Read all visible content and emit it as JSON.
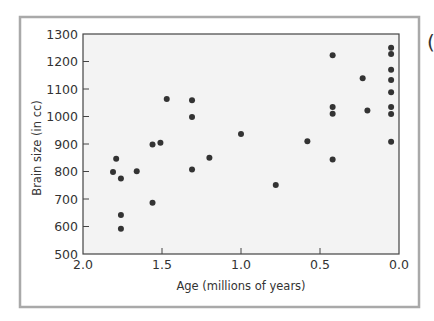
{
  "chart_data": {
    "type": "scatter",
    "title": "",
    "xlabel": "Age (millions of years)",
    "ylabel": "Brain size (in cc)",
    "xlim": [
      2.0,
      0.0
    ],
    "ylim": [
      500,
      1300
    ],
    "x_reversed": true,
    "grid": false,
    "legend": null,
    "x_ticks": [
      2.0,
      1.5,
      1.0,
      0.5,
      0.0
    ],
    "x_tick_labels": [
      "2.0",
      "1.5",
      "1.0",
      "0.5",
      "0.0"
    ],
    "y_ticks": [
      500,
      600,
      700,
      800,
      900,
      1000,
      1100,
      1200,
      1300
    ],
    "y_tick_labels": [
      "500",
      "600",
      "700",
      "800",
      "900",
      "1000",
      "1100",
      "1200",
      "1300"
    ],
    "series": [
      {
        "name": "Hominin fossils",
        "points": [
          {
            "x": 1.79,
            "y": 846
          },
          {
            "x": 1.81,
            "y": 798
          },
          {
            "x": 1.76,
            "y": 775
          },
          {
            "x": 1.76,
            "y": 642
          },
          {
            "x": 1.76,
            "y": 592
          },
          {
            "x": 1.66,
            "y": 801
          },
          {
            "x": 1.56,
            "y": 898
          },
          {
            "x": 1.56,
            "y": 686
          },
          {
            "x": 1.51,
            "y": 905
          },
          {
            "x": 1.47,
            "y": 1064
          },
          {
            "x": 1.31,
            "y": 1059
          },
          {
            "x": 1.31,
            "y": 998
          },
          {
            "x": 1.31,
            "y": 807
          },
          {
            "x": 1.2,
            "y": 850
          },
          {
            "x": 1.0,
            "y": 936
          },
          {
            "x": 0.78,
            "y": 751
          },
          {
            "x": 0.58,
            "y": 910
          },
          {
            "x": 0.42,
            "y": 1223
          },
          {
            "x": 0.42,
            "y": 1035
          },
          {
            "x": 0.42,
            "y": 1010
          },
          {
            "x": 0.42,
            "y": 844
          },
          {
            "x": 0.23,
            "y": 1139
          },
          {
            "x": 0.2,
            "y": 1022
          },
          {
            "x": 0.05,
            "y": 1250
          },
          {
            "x": 0.05,
            "y": 1227
          },
          {
            "x": 0.05,
            "y": 1170
          },
          {
            "x": 0.05,
            "y": 1133
          },
          {
            "x": 0.05,
            "y": 1088
          },
          {
            "x": 0.05,
            "y": 1035
          },
          {
            "x": 0.05,
            "y": 1009
          },
          {
            "x": 0.05,
            "y": 908
          }
        ]
      }
    ]
  },
  "style": {
    "frame_color": "#a9a9a9",
    "plot_bg": "#f3f3f3",
    "axis_color": "#444444",
    "point_color": "#333333"
  },
  "partial_glyph": "("
}
